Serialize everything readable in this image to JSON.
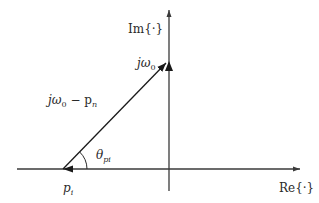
{
  "diagram": {
    "type": "pole-zero vector diagram (complex s-plane)",
    "colors": {
      "axis": "#3a3a3a",
      "vector": "#1a1a1a",
      "text": "#2a2a2a",
      "background": "#ffffff"
    },
    "axes": {
      "real": {
        "label_main": "Re",
        "label_arg": "{·}"
      },
      "imag": {
        "label_main": "Im",
        "label_arg": "{·}"
      }
    },
    "points": {
      "pole": {
        "symbol": "p",
        "subscript": "i"
      },
      "freq": {
        "symbol": "jω",
        "subscript": "0"
      }
    },
    "vector": {
      "label_main": "jω",
      "label_sub": "0",
      "label_rest": " − p",
      "label_rest_sub": "n"
    },
    "angle": {
      "symbol": "θ",
      "subscript": "pi"
    }
  }
}
